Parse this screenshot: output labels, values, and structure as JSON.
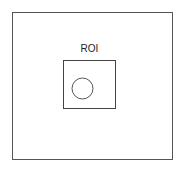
{
  "diagram": {
    "outer_box": {
      "x": 12,
      "y": 12,
      "width": 160,
      "height": 147,
      "stroke": "#555555"
    },
    "inner_box": {
      "x": 63,
      "y": 60,
      "width": 53,
      "height": 48,
      "stroke": "#444444"
    },
    "roi_label": "ROI",
    "circle": {
      "cx": 82.5,
      "cy": 88.5,
      "r": 10.5,
      "stroke": "#555555"
    }
  }
}
